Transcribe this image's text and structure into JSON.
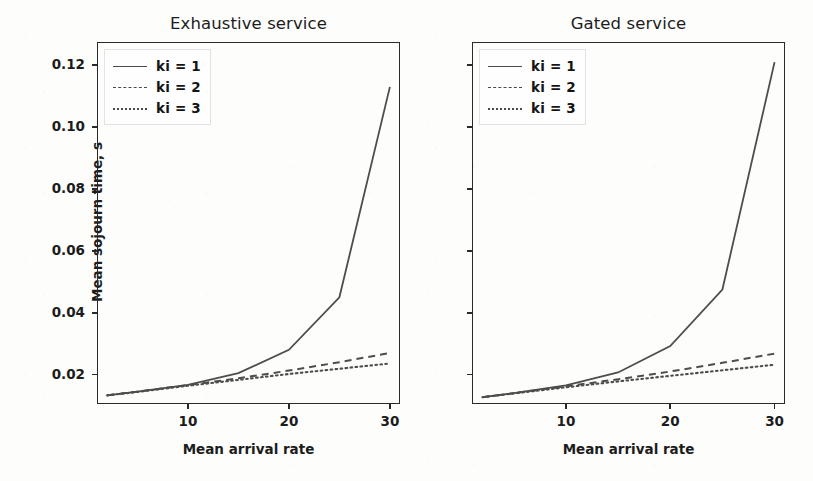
{
  "figure": {
    "width": 813,
    "height": 481,
    "background": "#fdfdfb",
    "line_color": "#4d4d4d",
    "axis_color": "#2a2a2a",
    "text_color": "#1c1c1c"
  },
  "shared": {
    "xlabel": "Mean arrival rate",
    "ylabel": "Mean sojourn time, s",
    "xtick_labels": [
      "10",
      "20",
      "30"
    ],
    "xtick_values": [
      10,
      20,
      30
    ],
    "ytick_labels": [
      "0.02",
      "0.04",
      "0.06",
      "0.08",
      "0.10",
      "0.12"
    ],
    "ytick_values": [
      0.02,
      0.04,
      0.06,
      0.08,
      0.1,
      0.12
    ],
    "legend": [
      {
        "label": "ki = 1",
        "style": "solid"
      },
      {
        "label": "ki = 2",
        "style": "dashed"
      },
      {
        "label": "ki = 3",
        "style": "dotted"
      }
    ]
  },
  "panels": [
    {
      "id": "left",
      "title": "Exhaustive service",
      "ytick_labels_visible": true
    },
    {
      "id": "right",
      "title": "Gated service",
      "ytick_labels_visible": false
    }
  ],
  "chart_data": [
    {
      "type": "line",
      "title": "Exhaustive service",
      "xlabel": "Mean arrival rate",
      "ylabel": "Mean sojourn time, s",
      "xlim": [
        1,
        31
      ],
      "ylim": [
        0.0105,
        0.1275
      ],
      "xticks": [
        10,
        20,
        30
      ],
      "yticks": [
        0.02,
        0.04,
        0.06,
        0.08,
        0.1,
        0.12
      ],
      "grid": false,
      "legend_position": "upper left",
      "x": [
        2,
        5,
        10,
        15,
        20,
        25,
        30
      ],
      "series": [
        {
          "name": "ki = 1",
          "style": "solid",
          "values": [
            0.0133,
            0.0145,
            0.0167,
            0.0205,
            0.028,
            0.045,
            0.113
          ]
        },
        {
          "name": "ki = 2",
          "style": "dashed",
          "values": [
            0.0133,
            0.0145,
            0.0166,
            0.0188,
            0.0213,
            0.024,
            0.027
          ]
        },
        {
          "name": "ki = 3",
          "style": "dotted",
          "values": [
            0.0133,
            0.0144,
            0.0164,
            0.0183,
            0.0202,
            0.0219,
            0.0236
          ]
        }
      ]
    },
    {
      "type": "line",
      "title": "Gated service",
      "xlabel": "Mean arrival rate",
      "ylabel": "Mean sojourn time, s",
      "xlim": [
        1,
        31
      ],
      "ylim": [
        0.0105,
        0.1275
      ],
      "xticks": [
        10,
        20,
        30
      ],
      "yticks": [
        0.02,
        0.04,
        0.06,
        0.08,
        0.1,
        0.12
      ],
      "grid": false,
      "legend_position": "upper left",
      "x": [
        2,
        5,
        10,
        15,
        20,
        25,
        30
      ],
      "series": [
        {
          "name": "ki = 1",
          "style": "solid",
          "values": [
            0.0127,
            0.014,
            0.0165,
            0.0207,
            0.0292,
            0.0475,
            0.121
          ]
        },
        {
          "name": "ki = 2",
          "style": "dashed",
          "values": [
            0.0127,
            0.014,
            0.0162,
            0.0185,
            0.021,
            0.0238,
            0.0268
          ]
        },
        {
          "name": "ki = 3",
          "style": "dotted",
          "values": [
            0.0127,
            0.0139,
            0.0159,
            0.0178,
            0.0196,
            0.0214,
            0.0232
          ]
        }
      ]
    }
  ]
}
